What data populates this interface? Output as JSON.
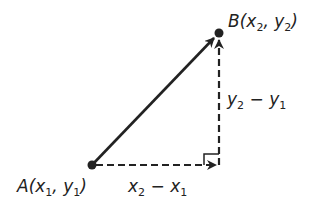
{
  "diagram": {
    "type": "vector-components",
    "points": {
      "A": {
        "name": "A",
        "coords_text": [
          "x",
          "1",
          "y",
          "1"
        ],
        "px": [
          92,
          165
        ]
      },
      "B": {
        "name": "B",
        "coords_text": [
          "x",
          "2",
          "y",
          "2"
        ],
        "px": [
          219,
          33
        ]
      }
    },
    "labels": {
      "A": {
        "letter": "A",
        "open": "(",
        "x": "x",
        "xsub": "1",
        "comma": ",",
        "y": "y",
        "ysub": "1",
        "close": ")"
      },
      "B": {
        "letter": "B",
        "open": "(",
        "x": "x",
        "xsub": "2",
        "comma": ",",
        "y": "y",
        "ysub": "2",
        "close": ")"
      },
      "dx": {
        "a": "x",
        "asub": "2",
        "op": " − ",
        "b": "x",
        "bsub": "1"
      },
      "dy": {
        "a": "y",
        "asub": "2",
        "op": " − ",
        "b": "y",
        "bsub": "1"
      }
    },
    "edges": [
      {
        "from": "A",
        "to": "B",
        "style": "solid",
        "arrow": true
      },
      {
        "from": "A",
        "to": "corner",
        "style": "dashed",
        "arrow": true
      },
      {
        "from": "corner",
        "to": "B",
        "style": "dashed",
        "arrow": true
      }
    ],
    "right_angle_marker": true,
    "colors": {
      "stroke": "#222222",
      "background": "#ffffff"
    }
  }
}
